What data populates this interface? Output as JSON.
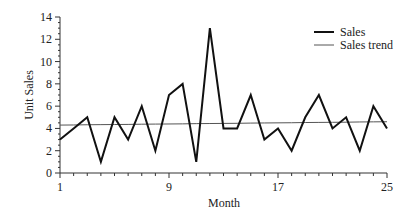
{
  "chart_data": {
    "type": "line",
    "title": "",
    "xlabel": "Month",
    "ylabel": "Unit Sales",
    "x": [
      1,
      2,
      3,
      4,
      5,
      6,
      7,
      8,
      9,
      10,
      11,
      12,
      13,
      14,
      15,
      16,
      17,
      18,
      19,
      20,
      21,
      22,
      23,
      24,
      25
    ],
    "series": [
      {
        "name": "Sales",
        "values": [
          3,
          4,
          5,
          1,
          5,
          3,
          6,
          2,
          7,
          8,
          1,
          13,
          4,
          4,
          7,
          3,
          4,
          2,
          5,
          7,
          4,
          5,
          2,
          6,
          4
        ]
      },
      {
        "name": "Sales trend",
        "values": [
          4.3,
          4.31,
          4.33,
          4.34,
          4.35,
          4.36,
          4.38,
          4.39,
          4.4,
          4.41,
          4.43,
          4.44,
          4.45,
          4.46,
          4.48,
          4.49,
          4.5,
          4.51,
          4.53,
          4.54,
          4.55,
          4.56,
          4.58,
          4.59,
          4.6
        ]
      }
    ],
    "xticks": [
      "1",
      "9",
      "17",
      "25"
    ],
    "yticks": [
      "0",
      "2",
      "4",
      "6",
      "8",
      "10",
      "12",
      "14"
    ],
    "xlim": [
      1,
      25
    ],
    "ylim": [
      0,
      14
    ],
    "grid": false,
    "legend_position": "upper right"
  },
  "legend": {
    "sales": "Sales",
    "trend": "Sales trend"
  },
  "axes": {
    "xlabel": "Month",
    "ylabel": "Unit Sales"
  }
}
